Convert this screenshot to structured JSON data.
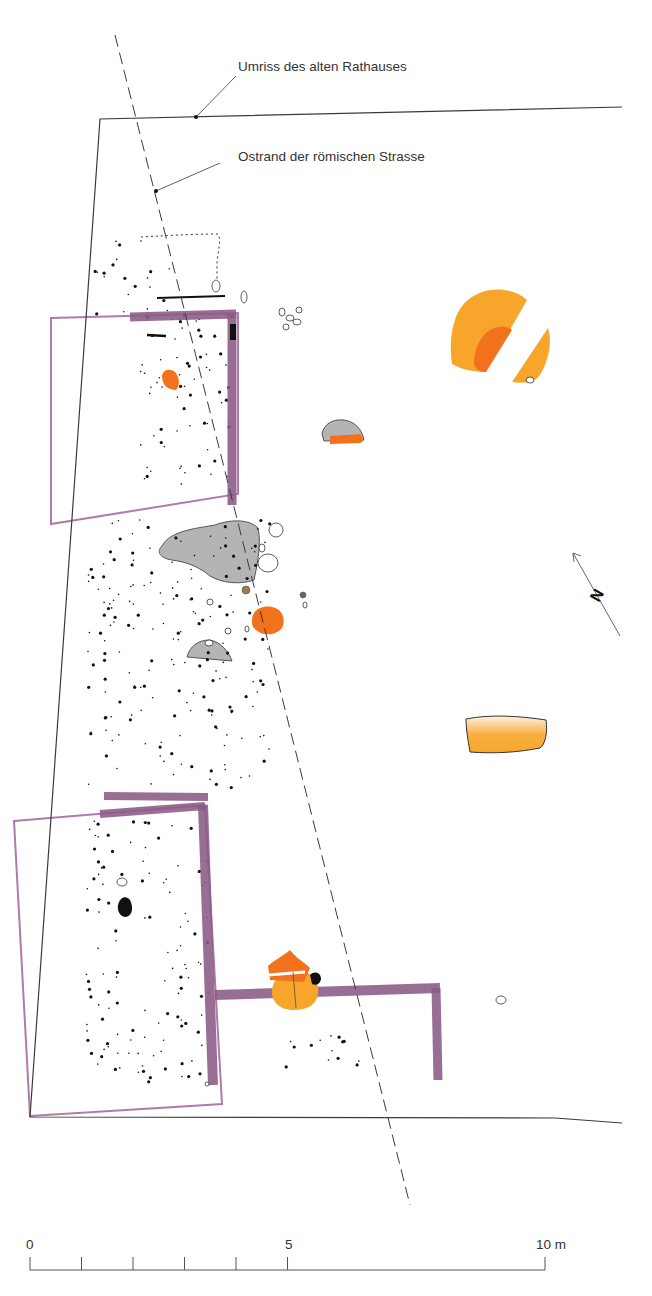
{
  "colors": {
    "line": "#3a3a3a",
    "wall": "#8a5a86",
    "wall_outline": "#b07aab",
    "orange_dark": "#f2711c",
    "orange_light": "#f7a62b",
    "gray_fill": "#b4b4b4",
    "dot": "#111111",
    "brown_dot": "#9a7a50"
  },
  "annotations": [
    {
      "id": "rathaus",
      "text": "Umriss des alten Rathauses",
      "x": 238,
      "y": 66,
      "leader": [
        [
          236,
          76
        ],
        [
          196,
          117
        ]
      ]
    },
    {
      "id": "strasse",
      "text": "Ostrand der römischen Strasse",
      "x": 238,
      "y": 156,
      "leader": [
        [
          220,
          163
        ],
        [
          156,
          191
        ]
      ]
    }
  ],
  "building_outline": {
    "points": [
      [
        622,
        107
      ],
      [
        100,
        119
      ],
      [
        30,
        1117
      ],
      [
        555,
        1118
      ],
      [
        622,
        1123
      ]
    ]
  },
  "road_edge": {
    "from": [
      115,
      35
    ],
    "to": [
      410,
      1205
    ]
  },
  "north_arrow": {
    "from": [
      620,
      636
    ],
    "to": [
      573,
      553
    ],
    "label": "N",
    "label_x": 598,
    "label_y": 596,
    "rotation": -60
  },
  "scale_bar": {
    "x0": 30,
    "x10": 545,
    "y": 1270,
    "tick_top": 1257,
    "ticks_m": [
      0,
      1,
      2,
      3,
      4,
      5,
      10
    ],
    "labels": [
      {
        "text": "0",
        "m": 0
      },
      {
        "text": "5",
        "m": 5
      },
      {
        "text": "10 m",
        "m": 10
      }
    ]
  },
  "boxes": [
    {
      "id": "upper-box",
      "points": [
        [
          51,
          318
        ],
        [
          238,
          313
        ],
        [
          238,
          494
        ],
        [
          51,
          524
        ]
      ]
    },
    {
      "id": "lower-box",
      "points": [
        [
          14,
          821
        ],
        [
          205,
          805
        ],
        [
          222,
          1104
        ],
        [
          30,
          1116
        ]
      ]
    }
  ],
  "walls": [
    {
      "id": "upper-wall-top",
      "d": "M130 317 L236 314",
      "w": 9
    },
    {
      "id": "upper-wall-right",
      "d": "M232 314 L232 505",
      "w": 9
    },
    {
      "id": "lower-wall-top1",
      "d": "M104 796 L208 797",
      "w": 8
    },
    {
      "id": "lower-wall-top2",
      "d": "M100 814 L205 806",
      "w": 8
    },
    {
      "id": "lower-wall-right",
      "d": "M203 805 L213 1085",
      "w": 10
    },
    {
      "id": "cross-wall",
      "d": "M215 995 L440 988",
      "w": 10
    },
    {
      "id": "east-wall",
      "d": "M436 988 L438 1080",
      "w": 9
    }
  ],
  "gray_areas": [
    {
      "id": "gray-large",
      "d": "M162 546 C170 530 200 528 215 525 C228 520 248 518 258 528 C262 545 256 570 254 580 C240 585 222 583 210 576 C198 566 186 562 172 560 C160 558 156 552 162 546 Z"
    },
    {
      "id": "gray-small",
      "d": "M187 657 C190 646 198 640 210 640 C220 642 228 650 232 661 Z"
    },
    {
      "id": "gray-mid",
      "d": "M322 434 C324 424 332 419 344 420 C356 422 362 430 364 440 L324 441 Z"
    }
  ],
  "orange_areas": [
    {
      "id": "orange-upper-small",
      "d": "M162 376 C163 369 170 368 175 372 C180 378 180 386 176 390 C168 390 162 385 162 376 Z",
      "fill": "#f2711c"
    },
    {
      "id": "orange-round",
      "d": "M252 620 C252 610 262 605 272 607 C283 609 286 620 282 628 C276 636 262 636 256 630 C252 627 252 624 252 620 Z",
      "fill": "#f2711c"
    },
    {
      "id": "orange-mid-strip",
      "d": "M330 436 L360 434 C364 438 364 442 360 443 L330 444 Z",
      "fill": "#f2711c"
    },
    {
      "id": "orange-big-left",
      "d": "M455 320 C460 305 470 294 490 290 C505 288 518 292 527 300 L486 372 C475 372 462 370 452 364 C450 350 450 334 455 320 Z",
      "fill": "#f7a62b"
    },
    {
      "id": "orange-big-left-inner",
      "d": "M487 332 C495 326 505 324 512 330 L486 372 C480 372 476 370 474 364 C474 352 478 340 487 332 Z",
      "fill": "#f2711c"
    },
    {
      "id": "orange-big-right",
      "d": "M548 328 C552 340 550 358 540 375 C535 382 526 384 512 382 Z",
      "fill": "#f7a62b"
    },
    {
      "id": "orange-east",
      "d": "M466 719 C490 714 520 716 546 720 C548 732 545 745 540 748 C520 752 496 754 470 752 C468 740 466 730 466 719 Z",
      "fill": "#f7a62b"
    },
    {
      "id": "orange-cluster-circle",
      "d": "M272 992 C272 978 284 970 296 970 C310 970 320 980 318 994 C316 1006 306 1010 294 1010 C282 1010 272 1004 272 992 Z",
      "fill": "#f7a62b"
    },
    {
      "id": "orange-cluster-top",
      "d": "M268 966 C274 960 282 957 290 950 C296 958 304 962 310 968 L304 982 L270 980 Z",
      "fill": "#f2711c"
    }
  ],
  "white_rocks": [
    [
      216,
      286,
      4,
      6
    ],
    [
      282,
      312,
      3,
      4
    ],
    [
      290,
      318,
      4,
      3
    ],
    [
      297,
      322,
      4,
      3
    ],
    [
      286,
      327,
      3,
      3
    ],
    [
      299,
      310,
      3,
      3
    ],
    [
      244,
      297,
      3,
      6
    ],
    [
      268,
      563,
      10,
      9
    ],
    [
      276,
      530,
      7,
      7
    ],
    [
      262,
      548,
      3,
      4
    ],
    [
      209,
      643,
      4,
      3
    ],
    [
      210,
      602,
      3,
      3
    ],
    [
      228,
      631,
      3,
      3
    ],
    [
      247,
      629,
      2,
      3
    ],
    [
      305,
      605,
      2,
      3
    ],
    [
      501,
      1000,
      5,
      4
    ],
    [
      122,
      882,
      5,
      4
    ],
    [
      207,
      1084,
      2,
      2
    ],
    [
      530,
      380,
      4,
      3
    ]
  ],
  "dots_region": [
    {
      "id": "upper-dots",
      "bbox": [
        140,
        305,
        230,
        490
      ],
      "count": 70
    },
    {
      "id": "mid-dots",
      "bbox": [
        88,
        520,
        270,
        790
      ],
      "count": 190
    },
    {
      "id": "lower-dots",
      "bbox": [
        85,
        820,
        210,
        1085
      ],
      "count": 120
    },
    {
      "id": "south-dots",
      "bbox": [
        265,
        1035,
        360,
        1070
      ],
      "count": 14
    },
    {
      "id": "north-dots",
      "bbox": [
        95,
        240,
        175,
        315
      ],
      "count": 18
    }
  ],
  "black_blobs": [
    {
      "id": "black-blob-lower",
      "d": "M118 905 C120 897 126 895 130 900 C134 908 132 916 126 917 C120 917 117 911 118 905 Z"
    },
    {
      "id": "black-upper-wall-end",
      "d": "M230 324 L236 324 L236 340 L230 340 Z"
    },
    {
      "id": "black-cluster",
      "d": "M310 975 C314 971 320 972 321 978 C321 984 316 986 312 984 Z"
    }
  ],
  "small_markers": [
    {
      "id": "brown-dot",
      "x": 246,
      "y": 590,
      "r": 4,
      "fill": "#9a7a50"
    },
    {
      "id": "gray-dot",
      "x": 303,
      "y": 595,
      "r": 3,
      "fill": "#666666"
    }
  ],
  "dotted_outline": {
    "d": "M141 242 L141 237 C160 236 190 234 218 234 L220 240 L217 262 L217 292"
  },
  "black_bars": [
    {
      "d": "M157 298 L225 296",
      "w": 2
    },
    {
      "d": "M147 335 L166 336",
      "w": 2.5
    }
  ]
}
